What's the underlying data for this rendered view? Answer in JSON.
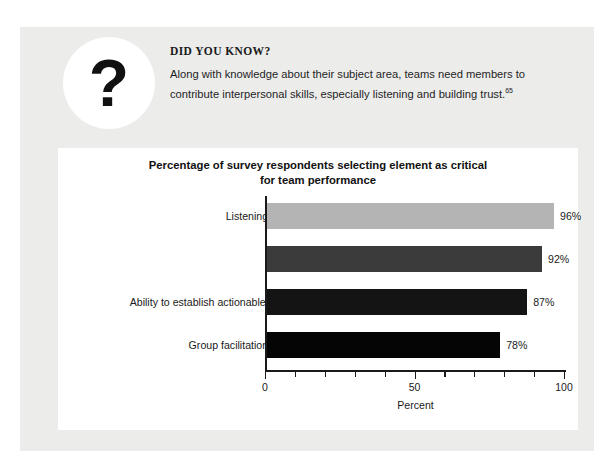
{
  "callout": {
    "icon": "question-mark-icon",
    "icon_glyph": "?",
    "heading": "DID YOU KNOW?",
    "body": "Along with knowledge about their subject area, teams need members to contribute interpersonal skills, especially listening and building trust.",
    "footnote_marker": "65"
  },
  "chart_data": {
    "type": "bar",
    "orientation": "horizontal",
    "title": "Percentage of survey respondents selecting element as critical for team performance",
    "title_line1": "Percentage of survey respondents selecting element as critical",
    "title_line2": "for team performance",
    "categories": [
      "Listening skills",
      "Trust",
      "Ability to establish actionable items",
      "Group facilitation skills"
    ],
    "values": [
      96,
      92,
      87,
      78
    ],
    "value_labels": [
      "96%",
      "92%",
      "87%",
      "78%"
    ],
    "bar_colors": [
      "#b4b4b4",
      "#3b3b3b",
      "#141414",
      "#050505"
    ],
    "xlabel": "Percent",
    "ylabel": "",
    "xlim": [
      0,
      100
    ],
    "xticks_major": [
      0,
      50,
      100
    ],
    "xtick_labels": [
      "0",
      "50",
      "100"
    ],
    "xticks_minor_step": 10,
    "grid": false,
    "legend": false
  },
  "colors": {
    "page_background": "#ffffff",
    "panel_background": "#ececeb",
    "card_background": "#ffffff",
    "text": "#1a1a1a",
    "axis": "#1a1a1a"
  }
}
